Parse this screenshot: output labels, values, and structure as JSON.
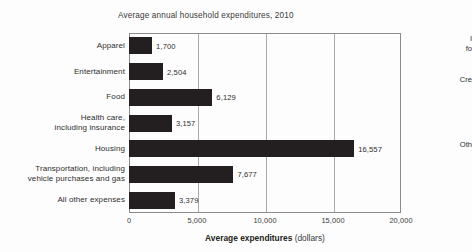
{
  "chart_data": {
    "type": "bar",
    "orientation": "horizontal",
    "title": "Average annual household expenditures, 2010",
    "xlabel_bold": "Average expenditures",
    "xlabel_unit": "(dollars)",
    "ylabel": "",
    "xlim": [
      0,
      20000
    ],
    "grid": true,
    "legend": "none",
    "bar_color": "#231f20",
    "categories": [
      "Apparel",
      "Entertainment",
      "Food",
      "Health care,\nincluding insurance",
      "Housing",
      "Transportation, including\nvehicle purchases and gas",
      "All other expenses"
    ],
    "values": [
      1700,
      2504,
      6129,
      3157,
      16557,
      7677,
      3379
    ],
    "value_labels": [
      "1,700",
      "2,504",
      "6,129",
      "3,157",
      "16,557",
      "7,677",
      "3,379"
    ],
    "xticks": [
      0,
      5000,
      10000,
      15000,
      20000
    ],
    "xtick_labels": [
      "0",
      "5,000",
      "10,000",
      "15,000",
      "20,000"
    ]
  },
  "margin_notes": [
    {
      "text": "I\nfo"
    },
    {
      "text": "Cre"
    },
    {
      "text": "Oth"
    }
  ]
}
